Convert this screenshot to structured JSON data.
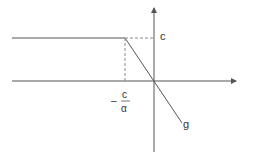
{
  "diagram": {
    "type": "piecewise-linear-function",
    "labels": {
      "c_axis": "c",
      "x_tick_minus": "–",
      "x_tick_numerator": "c",
      "x_tick_denominator": "α",
      "curve": "g"
    },
    "geometry": {
      "origin": [
        154,
        81
      ],
      "x_axis": {
        "from": [
          12,
          81
        ],
        "to": [
          237,
          81
        ]
      },
      "y_axis": {
        "from": [
          154,
          152
        ],
        "to": [
          154,
          7
        ]
      },
      "plateau": {
        "from": [
          12,
          38
        ],
        "to": [
          125,
          38
        ]
      },
      "slope": {
        "from": [
          125,
          38
        ],
        "to": [
          182,
          123
        ]
      },
      "dashed_horizontal": {
        "from": [
          125,
          38
        ],
        "to": [
          154,
          38
        ]
      },
      "dashed_vertical": {
        "from": [
          125,
          38
        ],
        "to": [
          125,
          81
        ]
      }
    },
    "colors": {
      "line": "#555555",
      "dashed": "#888888",
      "text": "#333333"
    }
  }
}
